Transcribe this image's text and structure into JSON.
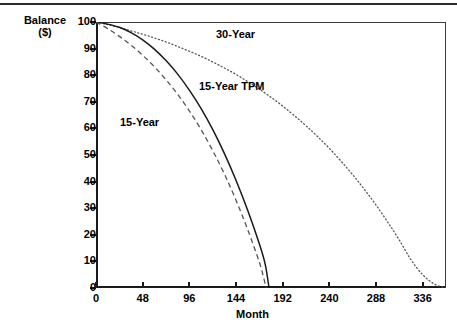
{
  "figure": {
    "top_rule": true,
    "background": "#ffffff",
    "ink": "#000000"
  },
  "axes": {
    "y_title_line1": "Balance",
    "y_title_line2": "($)",
    "x_title": "Month"
  },
  "chart_data": {
    "type": "line",
    "title": "",
    "subtitle": "",
    "xlabel": "Month",
    "ylabel": "Balance ($)",
    "xlim": [
      0,
      360
    ],
    "ylim": [
      0,
      100
    ],
    "xticks": [
      0,
      48,
      96,
      144,
      192,
      240,
      288,
      336
    ],
    "yticks": [
      0,
      10,
      20,
      30,
      40,
      50,
      60,
      70,
      80,
      90,
      100
    ],
    "grid": false,
    "legend": "inline-annotations",
    "annotations": [
      {
        "text": "30-Year",
        "x": 175,
        "y": 95
      },
      {
        "text": "15-Year  TPM",
        "x": 160,
        "y": 76
      },
      {
        "text": "15-Year",
        "x": 40,
        "y": 62
      }
    ],
    "series": [
      {
        "name": "30-Year",
        "style": "dotted",
        "color": "#555555",
        "x": [
          0,
          12,
          24,
          36,
          48,
          60,
          72,
          84,
          96,
          108,
          120,
          132,
          144,
          156,
          168,
          180,
          192,
          204,
          216,
          228,
          240,
          252,
          264,
          276,
          288,
          300,
          312,
          324,
          336,
          348,
          360
        ],
        "values": [
          100,
          99.0,
          97.9,
          96.7,
          95.4,
          94.0,
          92.5,
          90.8,
          89.0,
          87.1,
          85.0,
          82.7,
          80.3,
          77.6,
          74.8,
          71.7,
          68.4,
          64.8,
          61.0,
          56.9,
          52.5,
          47.7,
          42.6,
          37.1,
          31.2,
          24.8,
          18.0,
          10.6,
          5.0,
          1.5,
          0
        ]
      },
      {
        "name": "15-Year TPM",
        "style": "solid",
        "color": "#1a1a1a",
        "x": [
          0,
          12,
          24,
          36,
          48,
          60,
          72,
          84,
          96,
          108,
          120,
          132,
          144,
          156,
          168,
          174,
          178
        ],
        "values": [
          100,
          99.2,
          98.0,
          96.0,
          93.3,
          89.8,
          85.5,
          80.4,
          74.4,
          67.5,
          59.6,
          50.6,
          40.5,
          29.2,
          16.6,
          9.0,
          0
        ]
      },
      {
        "name": "15-Year",
        "style": "dashed",
        "color": "#555555",
        "x": [
          0,
          12,
          24,
          36,
          48,
          60,
          72,
          84,
          96,
          108,
          120,
          132,
          144,
          156,
          168,
          172,
          175
        ],
        "values": [
          100,
          97.5,
          94.6,
          91.3,
          87.5,
          83.2,
          78.3,
          72.8,
          66.6,
          59.6,
          51.7,
          42.9,
          33.0,
          22.0,
          9.7,
          4.5,
          0
        ]
      }
    ]
  }
}
